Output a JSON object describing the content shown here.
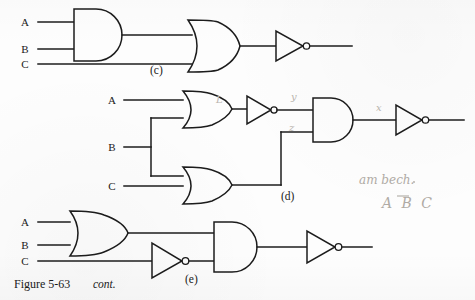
{
  "figure": {
    "caption_main": "Figure 5-63",
    "caption_italic": "cont.",
    "part_labels": {
      "c": "(c)",
      "d": "(d)",
      "e": "(e)"
    }
  },
  "part_c": {
    "inputs": [
      {
        "label": "A",
        "x": 28,
        "y": 22
      },
      {
        "label": "B",
        "x": 28,
        "y": 49
      },
      {
        "label": "C",
        "x": 28,
        "y": 64
      }
    ],
    "gates": [
      {
        "name": "and-gate",
        "type": "AND",
        "inputs": [
          "A",
          "B"
        ],
        "output": "AB"
      },
      {
        "name": "or-gate",
        "type": "OR",
        "inputs": [
          "AB",
          "C"
        ],
        "output": "AB+C"
      },
      {
        "name": "inverter",
        "type": "NOT",
        "inputs": [
          "AB+C"
        ],
        "output": "(AB+C)'"
      }
    ]
  },
  "part_d": {
    "inputs": [
      {
        "label": "A",
        "x": 114,
        "y": 100
      },
      {
        "label": "B",
        "x": 114,
        "y": 147
      },
      {
        "label": "C",
        "x": 114,
        "y": 186
      }
    ],
    "gates": [
      {
        "name": "or-gate-top",
        "type": "OR",
        "inputs": [
          "A",
          "B"
        ],
        "output": "L"
      },
      {
        "name": "or-gate-bottom",
        "type": "OR",
        "inputs": [
          "B",
          "C"
        ],
        "output": "z"
      },
      {
        "name": "inverter-mid",
        "type": "NOT",
        "inputs": [
          "L"
        ],
        "output": "y"
      },
      {
        "name": "and-gate",
        "type": "AND",
        "inputs": [
          "y",
          "z"
        ],
        "output": "x"
      },
      {
        "name": "inverter-out",
        "type": "NOT",
        "inputs": [
          "x"
        ],
        "output": "x'"
      }
    ],
    "annotations": [
      {
        "name": "wire-label-L",
        "text": "L",
        "x": 216,
        "y": 103
      },
      {
        "name": "wire-label-y",
        "text": "y",
        "x": 291,
        "y": 100
      },
      {
        "name": "wire-label-z",
        "text": "z",
        "x": 289,
        "y": 128
      },
      {
        "name": "wire-label-x",
        "text": "x",
        "x": 376,
        "y": 107
      }
    ]
  },
  "part_e": {
    "inputs": [
      {
        "label": "A",
        "x": 28,
        "y": 222
      },
      {
        "label": "B",
        "x": 28,
        "y": 245
      },
      {
        "label": "C",
        "x": 28,
        "y": 261
      }
    ],
    "gates": [
      {
        "name": "or-gate",
        "type": "OR",
        "inputs": [
          "A",
          "B"
        ],
        "output": "A+B"
      },
      {
        "name": "inverter-mid",
        "type": "NOT",
        "inputs": [
          "C"
        ],
        "output": "C'"
      },
      {
        "name": "and-gate",
        "type": "AND",
        "inputs": [
          "A+B",
          "C'"
        ],
        "output": "(A+B)C'"
      },
      {
        "name": "inverter-out",
        "type": "NOT",
        "inputs": [
          "(A+B)C'"
        ],
        "output": "((A+B)C')'"
      }
    ]
  },
  "handwritten_notes": [
    {
      "name": "handwritten-note-phrase",
      "text": "am bech.",
      "x": 359,
      "y": 184
    },
    {
      "name": "handwritten-note-expression",
      "text": "A B C",
      "x": 382,
      "y": 207,
      "overbar_on": "B"
    }
  ],
  "colors": {
    "ink": "#1c1c1c",
    "pencil": "#b9b4ae",
    "paper": "#fdfdfd"
  }
}
